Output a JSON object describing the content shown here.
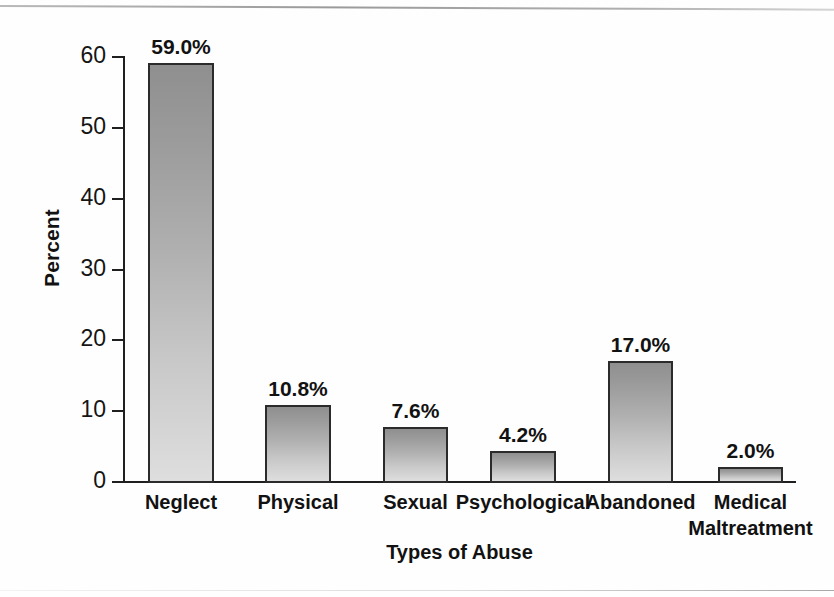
{
  "chart_data": {
    "type": "bar",
    "title": "",
    "xlabel": "Types of Abuse",
    "ylabel": "Percent",
    "categories": [
      "Neglect",
      "Physical",
      "Sexual",
      "Psychological",
      "Abandoned",
      "Medical\nMaltreatment"
    ],
    "values": [
      59.0,
      10.8,
      7.6,
      4.2,
      17.0,
      2.0
    ],
    "value_labels": [
      "59.0%",
      "10.8%",
      "7.6%",
      "4.2%",
      "17.0%",
      "2.0%"
    ],
    "ylim": [
      0,
      60
    ],
    "yticks": [
      0,
      10,
      20,
      30,
      40,
      50,
      60
    ],
    "ytick_labels": [
      "0",
      "10",
      "20",
      "30",
      "40",
      "50",
      "60"
    ],
    "grid": false,
    "legend": "none",
    "bar_fill_top": "#8f8f8f",
    "bar_fill_bottom": "#dedede",
    "bar_border": "#2b2b2b",
    "axis_color": "#1f1f1f"
  }
}
